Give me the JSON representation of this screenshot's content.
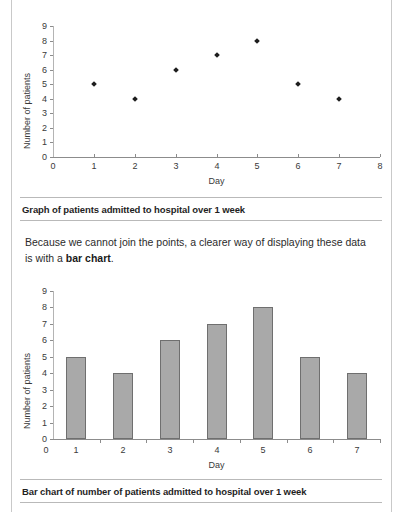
{
  "page": {
    "clipped_top_text": "",
    "body_paragraph_lead": "Because we cannot join the points, a clearer way of displaying these data is with a ",
    "body_paragraph_bold": "bar chart",
    "body_paragraph_tail": "."
  },
  "figure1": {
    "caption": "Graph of patients admitted to hospital over 1 week"
  },
  "figure2": {
    "caption": "Bar chart of number of patients admitted to hospital over 1 week"
  },
  "chart_data": [
    {
      "type": "scatter",
      "title": "Graph of patients admitted to hospital over 1 week",
      "xlabel": "Day",
      "ylabel": "Number of patients",
      "x": [
        1,
        2,
        3,
        4,
        5,
        6,
        7
      ],
      "values": [
        5,
        4,
        6,
        7,
        8,
        5,
        4
      ],
      "xlim": [
        0,
        8
      ],
      "ylim": [
        0,
        9
      ],
      "xticks": [
        0,
        1,
        2,
        3,
        4,
        5,
        6,
        7,
        8
      ],
      "yticks": [
        0,
        1,
        2,
        3,
        4,
        5,
        6,
        7,
        8,
        9
      ],
      "grid": false,
      "legend": "none",
      "marker": "diamond",
      "marker_color": "#1d1d1d"
    },
    {
      "type": "bar",
      "title": "Bar chart of number of patients admitted to hospital over 1 week",
      "xlabel": "Day",
      "ylabel": "Number of patients",
      "categories": [
        "1",
        "2",
        "3",
        "4",
        "5",
        "6",
        "7"
      ],
      "values": [
        5,
        4,
        6,
        7,
        8,
        5,
        4
      ],
      "ylim": [
        0,
        9
      ],
      "yticks": [
        0,
        1,
        2,
        3,
        4,
        5,
        6,
        7,
        8,
        9
      ],
      "grid": false,
      "legend": "none",
      "bar_color": "#a9a9a9",
      "bar_border_color": "#6f6f6f"
    }
  ]
}
